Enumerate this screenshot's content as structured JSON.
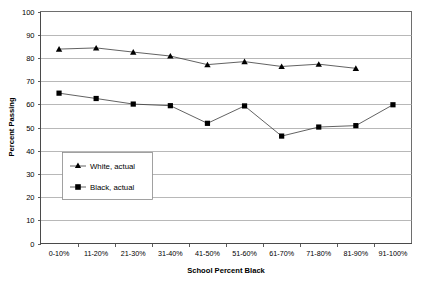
{
  "chart_data": {
    "type": "line",
    "title": "",
    "xlabel": "School Percent Black",
    "ylabel": "Percent Passing",
    "categories": [
      "0-10%",
      "11-20%",
      "21-30%",
      "31-40%",
      "41-50%",
      "51-60%",
      "61-70%",
      "71-80%",
      "81-90%",
      "91-100%"
    ],
    "ylim": [
      0,
      100
    ],
    "ytick_step": 10,
    "yticks": [
      "0",
      "10",
      "20",
      "30",
      "40",
      "50",
      "60",
      "70",
      "80",
      "90",
      "100"
    ],
    "grid": "horizontal",
    "legend_position": "inside-lower-left",
    "series": [
      {
        "name": "White, actual",
        "marker": "triangle",
        "color": "#000000",
        "values": [
          83.8,
          84.3,
          82.5,
          80.8,
          77.1,
          78.4,
          76.3,
          77.3,
          75.5,
          null
        ]
      },
      {
        "name": "Black, actual",
        "marker": "square",
        "color": "#000000",
        "values": [
          64.8,
          62.5,
          60.1,
          59.4,
          51.8,
          59.3,
          46.3,
          50.2,
          50.8,
          59.8
        ]
      }
    ]
  },
  "legend": {
    "entries": [
      {
        "label": "White, actual"
      },
      {
        "label": "Black, actual"
      }
    ]
  }
}
